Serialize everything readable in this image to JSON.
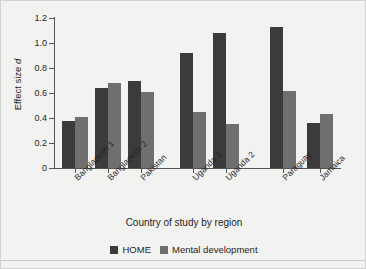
{
  "chart_data": {
    "type": "bar",
    "title": "",
    "xlabel": "Country of study by region",
    "ylabel": "Effect size d",
    "ylabel_plain": "Effect size",
    "ylabel_italic": "d",
    "categories": [
      "Bangladesh 1",
      "Bangladesh 2",
      "Pakistan",
      "Uganda 1",
      "Uganda 2",
      "Paraguay",
      "Jamaica"
    ],
    "series": [
      {
        "name": "HOME",
        "color": "#3b3b3b",
        "values": [
          0.38,
          0.64,
          0.7,
          0.92,
          1.08,
          1.13,
          0.36
        ]
      },
      {
        "name": "Mental development",
        "color": "#6f6f6f",
        "values": [
          0.41,
          0.68,
          0.61,
          0.45,
          0.35,
          0.62,
          0.43
        ]
      }
    ],
    "ylim": [
      0,
      1.2
    ],
    "ytick_values": [
      0,
      0.2,
      0.4,
      0.6,
      0.8,
      1.0,
      1.2
    ],
    "ytick_labels": [
      "0",
      "0.2",
      "0.4",
      "0.6",
      "0.8",
      "1.0",
      "1.2"
    ],
    "grid": false,
    "legend_position": "bottom-center",
    "region_groups": [
      {
        "name": "South Asia",
        "categories": [
          "Bangladesh 1",
          "Bangladesh 2",
          "Pakistan"
        ]
      },
      {
        "name": "Africa",
        "categories": [
          "Uganda 1",
          "Uganda 2"
        ]
      },
      {
        "name": "Latin America",
        "categories": [
          "Paraguay",
          "Jamaica"
        ]
      }
    ]
  },
  "legend": {
    "items": [
      {
        "label": "HOME",
        "color": "#3b3b3b"
      },
      {
        "label": "Mental development",
        "color": "#6f6f6f"
      }
    ]
  },
  "colors": {
    "background": "#f2f2f1",
    "axis": "#555453",
    "text": "#1f1f1f",
    "home": "#3b3b3b",
    "mental": "#6f6f6f"
  }
}
